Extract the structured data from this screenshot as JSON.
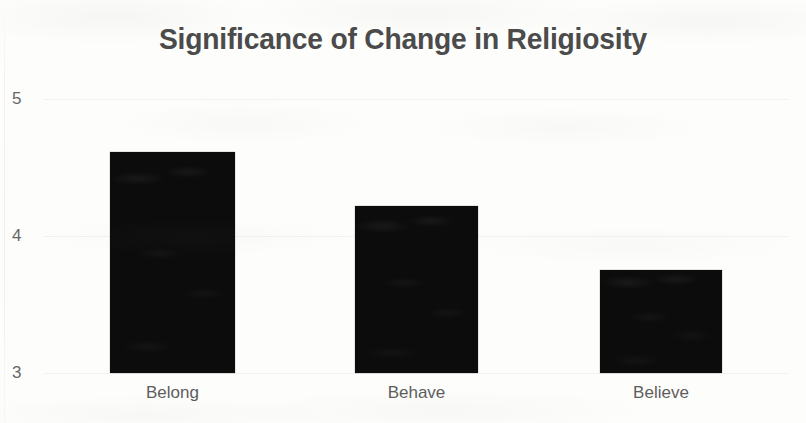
{
  "chart_data": {
    "type": "bar",
    "title": "Significance of Change in Religiosity",
    "xlabel": "",
    "ylabel": "",
    "categories": [
      "Belong",
      "Behave",
      "Believe"
    ],
    "values": [
      4.61,
      4.22,
      3.75
    ],
    "series": [
      {
        "name": "Significance of Change",
        "values": [
          4.61,
          4.22,
          3.75
        ]
      }
    ],
    "ylim": [
      3,
      5
    ],
    "ytick_labels": [
      "5",
      "4",
      "3"
    ],
    "ytick_values": [
      5,
      4,
      3
    ],
    "grid": true,
    "legend": false,
    "legend_position": "none",
    "bar_color": "#0c0c0c",
    "title_color": "#4b4b4b",
    "tick_color": "#676767",
    "label_color": "#5d5d5d",
    "gridline_color": "#f1f1ef",
    "background_color": "#fdfdfc"
  }
}
